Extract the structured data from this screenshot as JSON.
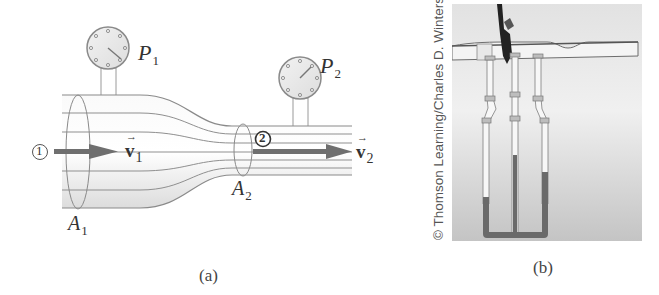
{
  "figure": {
    "panel_a": {
      "caption": "(a)",
      "gauge_1_label": "P",
      "gauge_1_sub": "1",
      "gauge_2_label": "P",
      "gauge_2_sub": "2",
      "area_1_label": "A",
      "area_1_sub": "1",
      "area_2_label": "A",
      "area_2_sub": "2",
      "point_1_marker": "1",
      "point_2_marker": "2",
      "velocity_1_label": "v",
      "velocity_1_sub": "1",
      "velocity_2_label": "v",
      "velocity_2_sub": "2",
      "vector_arrow": "→"
    },
    "panel_b": {
      "caption": "(b)",
      "copyright": "© Thomson Learning/Charles D. Winters"
    },
    "colors": {
      "outline": "#8a8a8a",
      "pipe_fill": "#e6e6e6",
      "arrow": "#6f6f6f",
      "fluid": "#6a6a6a",
      "photo_bg": "#cfcfcf"
    }
  }
}
